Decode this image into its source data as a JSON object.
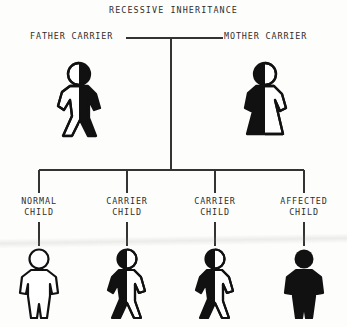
{
  "diagram": {
    "title": "RECESSIVE INHERITANCE",
    "type": "pedigree-chart",
    "ink_color": "#111111",
    "background_color": "#fdfdfc",
    "parents": [
      {
        "id": "father",
        "label": "FATHER CARRIER",
        "figure": "walking-man",
        "status": "carrier",
        "fill": "half",
        "filled_side": "right"
      },
      {
        "id": "mother",
        "label": "MOTHER CARRIER",
        "figure": "woman-in-dress",
        "status": "carrier",
        "fill": "half",
        "filled_side": "left"
      }
    ],
    "children": [
      {
        "id": "child-0",
        "label_line1": "NORMAL",
        "label_line2": "CHILD",
        "figure": "standing-child",
        "status": "normal",
        "fill": "none",
        "filled_side": "none"
      },
      {
        "id": "child-1",
        "label_line1": "CARRIER",
        "label_line2": "CHILD",
        "figure": "walking-child",
        "status": "carrier",
        "fill": "half",
        "filled_side": "left"
      },
      {
        "id": "child-2",
        "label_line1": "CARRIER",
        "label_line2": "CHILD",
        "figure": "walking-child",
        "status": "carrier",
        "fill": "half",
        "filled_side": "left"
      },
      {
        "id": "child-3",
        "label_line1": "AFFECTED",
        "label_line2": "CHILD",
        "figure": "standing-child",
        "status": "affected",
        "fill": "solid",
        "filled_side": "both"
      }
    ]
  }
}
